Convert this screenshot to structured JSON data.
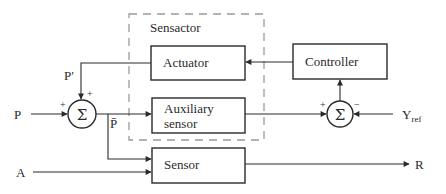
{
  "diagram": {
    "group": {
      "label": "Sensactor"
    },
    "blocks": {
      "actuator": {
        "label": "Actuator"
      },
      "auxiliary_sensor": {
        "line1": "Auxiliary",
        "line2": "sensor"
      },
      "sensor": {
        "label": "Sensor"
      },
      "controller": {
        "label": "Controller"
      }
    },
    "summing_junctions": {
      "left": {
        "symbol": "Σ",
        "sign_top": "+",
        "sign_left": "+"
      },
      "right": {
        "symbol": "Σ",
        "sign_left": "+",
        "sign_right": "−"
      }
    },
    "signals": {
      "p_input": "P",
      "p_prime": "P′",
      "p_bar": "P̄",
      "a_input": "A",
      "r_output": "R",
      "y_ref_main": "Y",
      "y_ref_sub": "ref"
    }
  }
}
